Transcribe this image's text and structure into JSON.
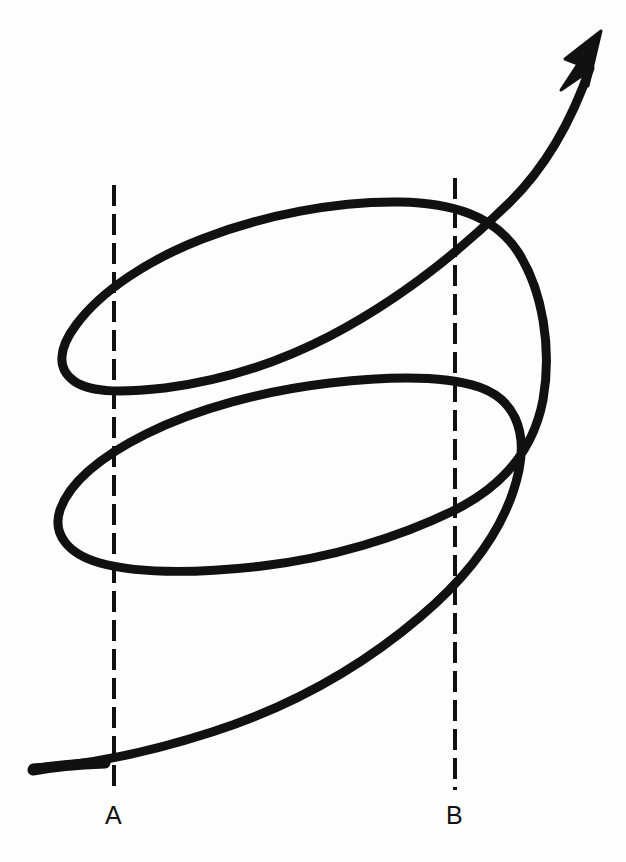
{
  "figure": {
    "background_color": "#fdfdfd",
    "stroke_color": "#111111",
    "stroke_width": 9,
    "width": 626,
    "height": 862
  },
  "labels": {
    "a": "A",
    "b": "B"
  },
  "chart_data": {
    "type": "line",
    "title": "",
    "xlabel": "",
    "ylabel": "",
    "grid": false,
    "legend": null,
    "annotations": [
      {
        "name": "reference-line-a",
        "label": "A",
        "type": "vertical-dashed-line",
        "x": 114,
        "y_start": 185,
        "y_end": 790
      },
      {
        "name": "reference-line-b",
        "label": "B",
        "type": "vertical-dashed-line",
        "x": 455,
        "y_start": 178,
        "y_end": 790
      },
      {
        "name": "arrowhead",
        "type": "arrow",
        "x": 600,
        "y": 32
      }
    ],
    "series": [
      {
        "name": "spiral-curve",
        "description": "Continuous hand-drawn spiral rising from lower-left, looping twice counterclockwise and exiting upper-right with an arrowhead",
        "points": [
          [
            33,
            768
          ],
          [
            120,
            760
          ],
          [
            210,
            733
          ],
          [
            300,
            690
          ],
          [
            380,
            635
          ],
          [
            447,
            572
          ],
          [
            497,
            512
          ],
          [
            519,
            452
          ],
          [
            512,
            410
          ],
          [
            478,
            386
          ],
          [
            420,
            379
          ],
          [
            340,
            381
          ],
          [
            250,
            398
          ],
          [
            160,
            432
          ],
          [
            95,
            470
          ],
          [
            58,
            508
          ],
          [
            62,
            545
          ],
          [
            110,
            566
          ],
          [
            190,
            570
          ],
          [
            290,
            560
          ],
          [
            390,
            534
          ],
          [
            470,
            494
          ],
          [
            528,
            440
          ],
          [
            544,
            370
          ],
          [
            540,
            305
          ],
          [
            512,
            246
          ],
          [
            462,
            214
          ],
          [
            390,
            203
          ],
          [
            300,
            207
          ],
          [
            210,
            228
          ],
          [
            130,
            263
          ],
          [
            75,
            303
          ],
          [
            57,
            343
          ],
          [
            72,
            374
          ],
          [
            120,
            389
          ],
          [
            200,
            385
          ],
          [
            290,
            357
          ],
          [
            380,
            310
          ],
          [
            460,
            251
          ],
          [
            530,
            175
          ],
          [
            580,
            85
          ],
          [
            600,
            32
          ]
        ]
      }
    ]
  }
}
